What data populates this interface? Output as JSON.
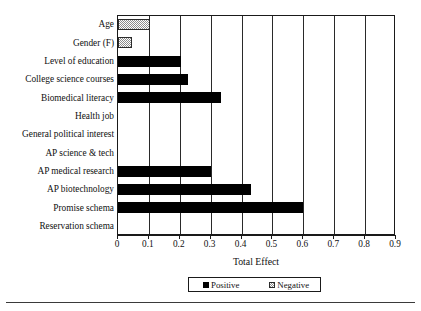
{
  "chart_data": {
    "type": "bar",
    "orientation": "horizontal",
    "title": "",
    "xlabel": "Total Effect",
    "ylabel": "",
    "xlim": [
      0,
      0.9
    ],
    "xticks": [
      "0",
      "0.1",
      "0.2",
      "0.3",
      "0.4",
      "0.5",
      "0.6",
      "0.7",
      "0.8",
      "0.9"
    ],
    "xtick_values": [
      0,
      0.1,
      0.2,
      0.3,
      0.4,
      0.5,
      0.6,
      0.7,
      0.8,
      0.9
    ],
    "grid": "vertical",
    "legend_position": "bottom-center",
    "categories": [
      "Age",
      "Gender (F)",
      "Level of education",
      "College science courses",
      "Biomedical literacy",
      "Health job",
      "General political interest",
      "AP science & tech",
      "AP medical research",
      "AP biotechnology",
      "Promise schema",
      "Reservation schema"
    ],
    "values": [
      0.105,
      0.045,
      0.205,
      0.225,
      0.335,
      0.0,
      0.0,
      0.0,
      0.3,
      0.43,
      0.6,
      0.0
    ],
    "effects": [
      "negative",
      "negative",
      "positive",
      "positive",
      "positive",
      "none",
      "none",
      "none",
      "positive",
      "positive",
      "positive",
      "none"
    ],
    "legend": [
      {
        "label": "Positive",
        "key": "positive"
      },
      {
        "label": "Negative",
        "key": "negative"
      }
    ],
    "colors": {
      "positive": "#000000",
      "negative": "#8d8d8d",
      "axis": "#1a1a1a",
      "grid": "#2a2a2a",
      "background": "#ffffff"
    }
  }
}
